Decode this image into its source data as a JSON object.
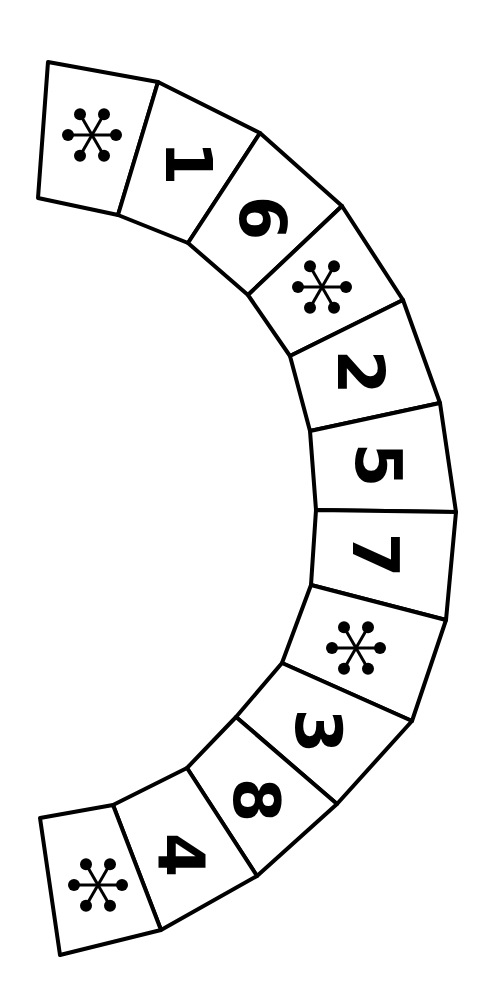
{
  "board": {
    "title": "",
    "shape": "arc-track",
    "line_color": "#000000",
    "background": "#ffffff",
    "cells": [
      {
        "type": "star",
        "label": "*",
        "symbol": "star-icon",
        "pts": [
          [
            48,
            62
          ],
          [
            158,
            82
          ],
          [
            118,
            215
          ],
          [
            38,
            198
          ]
        ],
        "cx": 92,
        "cy": 135,
        "rot": 90
      },
      {
        "type": "number",
        "label": "1",
        "pts": [
          [
            158,
            82
          ],
          [
            260,
            133
          ],
          [
            188,
            243
          ],
          [
            118,
            215
          ]
        ],
        "cx": 188,
        "cy": 163,
        "rot": 90
      },
      {
        "type": "number",
        "label": "6",
        "pts": [
          [
            260,
            133
          ],
          [
            342,
            206
          ],
          [
            248,
            295
          ],
          [
            188,
            243
          ]
        ],
        "cx": 262,
        "cy": 218,
        "rot": 90
      },
      {
        "type": "star",
        "label": "*",
        "symbol": "star-icon",
        "pts": [
          [
            342,
            206
          ],
          [
            403,
            300
          ],
          [
            290,
            356
          ],
          [
            248,
            295
          ]
        ],
        "cx": 322,
        "cy": 287,
        "rot": 90
      },
      {
        "type": "number",
        "label": "2",
        "pts": [
          [
            403,
            300
          ],
          [
            440,
            403
          ],
          [
            310,
            431
          ],
          [
            290,
            356
          ]
        ],
        "cx": 360,
        "cy": 372,
        "rot": 90
      },
      {
        "type": "number",
        "label": "5",
        "pts": [
          [
            440,
            403
          ],
          [
            456,
            512
          ],
          [
            316,
            510
          ],
          [
            310,
            431
          ]
        ],
        "cx": 378,
        "cy": 465,
        "rot": 90
      },
      {
        "type": "number",
        "label": "7",
        "pts": [
          [
            456,
            512
          ],
          [
            446,
            620
          ],
          [
            311,
            585
          ],
          [
            316,
            510
          ]
        ],
        "cx": 375,
        "cy": 555,
        "rot": 90
      },
      {
        "type": "star",
        "label": "*",
        "symbol": "star-icon",
        "pts": [
          [
            446,
            620
          ],
          [
            412,
            721
          ],
          [
            282,
            663
          ],
          [
            311,
            585
          ]
        ],
        "cx": 356,
        "cy": 648,
        "rot": 90
      },
      {
        "type": "number",
        "label": "3",
        "pts": [
          [
            412,
            721
          ],
          [
            337,
            804
          ],
          [
            236,
            717
          ],
          [
            282,
            663
          ]
        ],
        "cx": 318,
        "cy": 731,
        "rot": 90
      },
      {
        "type": "number",
        "label": "8",
        "pts": [
          [
            337,
            804
          ],
          [
            257,
            876
          ],
          [
            187,
            768
          ],
          [
            236,
            717
          ]
        ],
        "cx": 256,
        "cy": 800,
        "rot": 90
      },
      {
        "type": "number",
        "label": "4",
        "pts": [
          [
            257,
            876
          ],
          [
            161,
            930
          ],
          [
            113,
            805
          ],
          [
            187,
            768
          ]
        ],
        "cx": 180,
        "cy": 855,
        "rot": 90
      },
      {
        "type": "star",
        "label": "*",
        "symbol": "star-icon",
        "pts": [
          [
            161,
            930
          ],
          [
            60,
            955
          ],
          [
            40,
            818
          ],
          [
            113,
            805
          ]
        ],
        "cx": 98,
        "cy": 885,
        "rot": 90
      }
    ]
  }
}
